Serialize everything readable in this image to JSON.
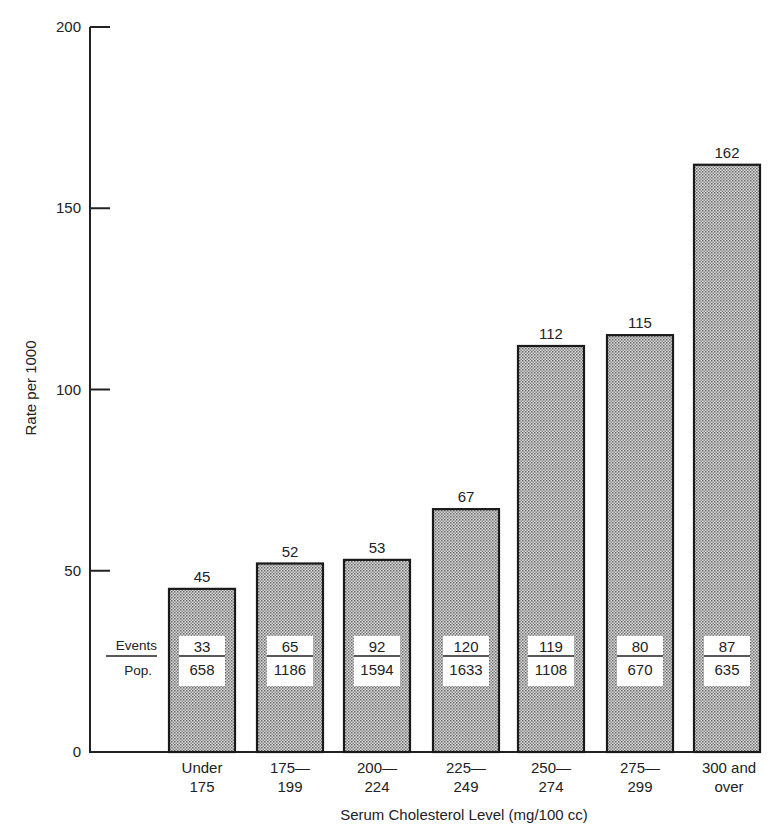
{
  "chart_data": {
    "type": "bar",
    "title": "",
    "xlabel": "Serum Cholesterol Level (mg/100 cc)",
    "ylabel": "Rate per 1000",
    "ylim": [
      0,
      200
    ],
    "yticks": [
      0,
      50,
      100,
      150,
      200
    ],
    "grid": false,
    "categories": [
      [
        "Under",
        "175"
      ],
      [
        "175—",
        "199"
      ],
      [
        "200—",
        "224"
      ],
      [
        "225—",
        "249"
      ],
      [
        "250—",
        "274"
      ],
      [
        "275—",
        "299"
      ],
      [
        "300 and",
        "over"
      ]
    ],
    "values": [
      45,
      52,
      53,
      67,
      112,
      115,
      162
    ],
    "events": [
      33,
      65,
      92,
      120,
      119,
      80,
      87
    ],
    "population": [
      658,
      1186,
      1594,
      1633,
      1108,
      670,
      635
    ],
    "fraction_legend": {
      "numerator": "Events",
      "denominator": "Pop."
    },
    "colors": {
      "bar_fill": "#b8b8b8",
      "bar_stroke": "#1a1a1a",
      "axis": "#222222"
    }
  }
}
